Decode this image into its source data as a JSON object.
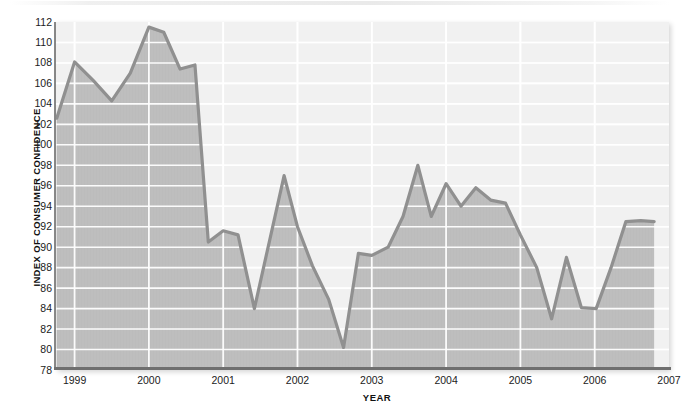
{
  "chart_data": {
    "type": "area",
    "title": "",
    "xlabel": "YEAR",
    "ylabel": "INDEX OF CONSUMER CONFIDENCE",
    "ylim": [
      78,
      112
    ],
    "xlim": [
      1998.75,
      2007.0
    ],
    "ytick_step": 2,
    "yticks": [
      112,
      110,
      108,
      106,
      104,
      102,
      100,
      98,
      96,
      94,
      92,
      90,
      88,
      86,
      84,
      82,
      80,
      78
    ],
    "xticks": [
      "1999",
      "2000",
      "2001",
      "2002",
      "2003",
      "2004",
      "2005",
      "2006",
      "2007"
    ],
    "xtick_values": [
      1999,
      2000,
      2001,
      2002,
      2003,
      2004,
      2005,
      2006,
      2007
    ],
    "grid": true,
    "grid_color": "#ffffff",
    "legend": false,
    "fill_color": "#bcbcbc",
    "plot_background": "#f1f1f1",
    "line_color": "#909090",
    "line_width": 3.2,
    "series": [
      {
        "name": "Index of Consumer Confidence",
        "x": [
          1998.76,
          1999.0,
          1999.25,
          1999.5,
          1999.75,
          2000.0,
          2000.2,
          2000.42,
          2000.62,
          2000.8,
          2001.0,
          2001.2,
          2001.42,
          2001.62,
          2001.82,
          2002.0,
          2002.2,
          2002.42,
          2002.62,
          2002.82,
          2003.0,
          2003.22,
          2003.42,
          2003.62,
          2003.8,
          2004.0,
          2004.2,
          2004.4,
          2004.6,
          2004.8,
          2005.0,
          2005.22,
          2005.42,
          2005.62,
          2005.82,
          2006.02,
          2006.22,
          2006.42,
          2006.62,
          2006.8
        ],
        "values": [
          102.6,
          108.1,
          106.3,
          104.3,
          107.0,
          111.5,
          111.0,
          107.4,
          107.8,
          90.5,
          91.6,
          91.2,
          84.0,
          90.5,
          97.0,
          92.0,
          88.2,
          84.9,
          80.2,
          89.4,
          89.2,
          90.0,
          93.0,
          98.0,
          93.0,
          96.2,
          94.0,
          95.8,
          94.6,
          94.3,
          91.2,
          88.0,
          83.0,
          89.0,
          84.1,
          84.0,
          88.0,
          92.5,
          92.6,
          92.5
        ]
      }
    ]
  },
  "axes": {
    "y_title": "INDEX OF CONSUMER CONFIDENCE",
    "x_title": "YEAR"
  },
  "figure": {
    "source_note": ""
  }
}
